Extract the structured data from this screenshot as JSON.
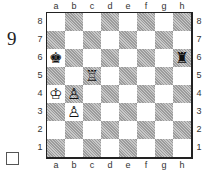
{
  "diagram": {
    "number": "9",
    "checkbox_checked": false
  },
  "board": {
    "files": [
      "a",
      "b",
      "c",
      "d",
      "e",
      "f",
      "g",
      "h"
    ],
    "ranks": [
      "8",
      "7",
      "6",
      "5",
      "4",
      "3",
      "2",
      "1"
    ],
    "pieces": {
      "a6": {
        "glyph": "♚",
        "name": "black-king"
      },
      "h6": {
        "glyph": "♜",
        "name": "black-rook"
      },
      "c5": {
        "glyph": "♖",
        "name": "white-rook"
      },
      "a4": {
        "glyph": "♔",
        "name": "white-king"
      },
      "b4": {
        "glyph": "♙",
        "name": "white-pawn"
      },
      "b3": {
        "glyph": "♙",
        "name": "white-pawn"
      }
    }
  },
  "colors": {
    "dark_square": "#b4b4b4",
    "light_square": "#ffffff",
    "border": "#222222"
  }
}
